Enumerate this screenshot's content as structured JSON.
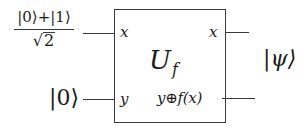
{
  "diagram": {
    "type": "quantum-circuit-oracle",
    "inputs": {
      "top_state": {
        "numerator": "|0⟩+|1⟩",
        "denominator_radical": "√",
        "denominator_value": "2"
      },
      "bottom_state": "|0⟩"
    },
    "gate": {
      "name": "U",
      "subscript": "f",
      "input_labels": {
        "top": "x",
        "bottom": "y"
      },
      "output_labels": {
        "top": "x",
        "bottom": "y⊕f(x)"
      }
    },
    "output_state": "|ψ⟩",
    "colors": {
      "line": "#3a3a3a",
      "text": "#1a1a1a",
      "background": "#ffffff"
    }
  }
}
